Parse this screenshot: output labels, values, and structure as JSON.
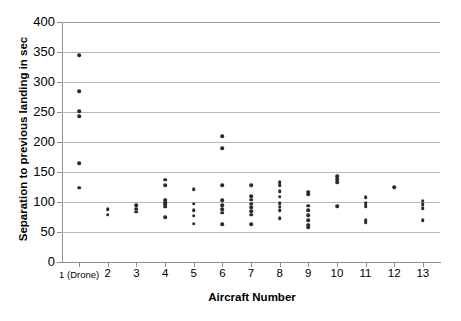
{
  "chart_data": {
    "type": "scatter",
    "title": "",
    "xlabel": "Aircraft Number",
    "ylabel": "Separation to previous landing in sec",
    "xlim": [
      0.4,
      13.6
    ],
    "ylim": [
      0,
      400
    ],
    "grid": true,
    "legend": null,
    "ytick_labels": [
      "400",
      "350",
      "300",
      "250",
      "200",
      "150",
      "100",
      "50",
      "0"
    ],
    "ytick_values": [
      400,
      350,
      300,
      250,
      200,
      150,
      100,
      50,
      0
    ],
    "xtick_labels": [
      "1 (Drone)",
      "2",
      "3",
      "4",
      "5",
      "6",
      "7",
      "8",
      "9",
      "10",
      "11",
      "12",
      "13"
    ],
    "xtick_values": [
      1,
      2,
      3,
      4,
      5,
      6,
      7,
      8,
      9,
      10,
      11,
      12,
      13
    ],
    "categories": [
      "1 (Drone)",
      "2",
      "3",
      "4",
      "5",
      "6",
      "7",
      "8",
      "9",
      "10",
      "11",
      "12",
      "13"
    ],
    "series": [
      {
        "name": "Separation to previous landing",
        "points": [
          {
            "x": 1,
            "y": 345
          },
          {
            "x": 1,
            "y": 285
          },
          {
            "x": 1,
            "y": 251
          },
          {
            "x": 1,
            "y": 243
          },
          {
            "x": 1,
            "y": 165
          },
          {
            "x": 1,
            "y": 124
          },
          {
            "x": 2,
            "y": 88
          },
          {
            "x": 2,
            "y": 79
          },
          {
            "x": 3,
            "y": 95
          },
          {
            "x": 3,
            "y": 89
          },
          {
            "x": 3,
            "y": 84
          },
          {
            "x": 4,
            "y": 137
          },
          {
            "x": 4,
            "y": 128
          },
          {
            "x": 4,
            "y": 104
          },
          {
            "x": 4,
            "y": 100
          },
          {
            "x": 4,
            "y": 96
          },
          {
            "x": 4,
            "y": 92
          },
          {
            "x": 4,
            "y": 75
          },
          {
            "x": 5,
            "y": 121
          },
          {
            "x": 5,
            "y": 97
          },
          {
            "x": 5,
            "y": 86
          },
          {
            "x": 5,
            "y": 77
          },
          {
            "x": 5,
            "y": 64
          },
          {
            "x": 6,
            "y": 210
          },
          {
            "x": 6,
            "y": 190
          },
          {
            "x": 6,
            "y": 128
          },
          {
            "x": 6,
            "y": 103
          },
          {
            "x": 6,
            "y": 95
          },
          {
            "x": 6,
            "y": 88
          },
          {
            "x": 6,
            "y": 82
          },
          {
            "x": 6,
            "y": 63
          },
          {
            "x": 7,
            "y": 128
          },
          {
            "x": 7,
            "y": 110
          },
          {
            "x": 7,
            "y": 104
          },
          {
            "x": 7,
            "y": 97
          },
          {
            "x": 7,
            "y": 91
          },
          {
            "x": 7,
            "y": 85
          },
          {
            "x": 7,
            "y": 79
          },
          {
            "x": 7,
            "y": 63
          },
          {
            "x": 8,
            "y": 133
          },
          {
            "x": 8,
            "y": 128
          },
          {
            "x": 8,
            "y": 118
          },
          {
            "x": 8,
            "y": 109
          },
          {
            "x": 8,
            "y": 98
          },
          {
            "x": 8,
            "y": 92
          },
          {
            "x": 8,
            "y": 86
          },
          {
            "x": 8,
            "y": 73
          },
          {
            "x": 9,
            "y": 117
          },
          {
            "x": 9,
            "y": 113
          },
          {
            "x": 9,
            "y": 94
          },
          {
            "x": 9,
            "y": 86
          },
          {
            "x": 9,
            "y": 78
          },
          {
            "x": 9,
            "y": 70
          },
          {
            "x": 9,
            "y": 62
          },
          {
            "x": 9,
            "y": 58
          },
          {
            "x": 10,
            "y": 143
          },
          {
            "x": 10,
            "y": 138
          },
          {
            "x": 10,
            "y": 133
          },
          {
            "x": 10,
            "y": 93
          },
          {
            "x": 11,
            "y": 108
          },
          {
            "x": 11,
            "y": 98
          },
          {
            "x": 11,
            "y": 93
          },
          {
            "x": 11,
            "y": 70
          },
          {
            "x": 11,
            "y": 66
          },
          {
            "x": 12,
            "y": 125
          },
          {
            "x": 13,
            "y": 102
          },
          {
            "x": 13,
            "y": 96
          },
          {
            "x": 13,
            "y": 90
          },
          {
            "x": 13,
            "y": 70
          }
        ]
      }
    ],
    "colors": {
      "marker": "#2b2b2b",
      "gridline": "#b7b7b7",
      "axis": "#8f8f8f",
      "text": "#000000",
      "background": "#ffffff"
    }
  }
}
